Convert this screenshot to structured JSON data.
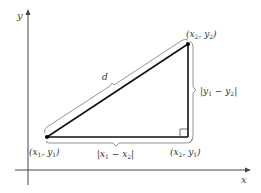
{
  "diagram": {
    "axes": {
      "x_label": "x",
      "y_label": "y"
    },
    "points": {
      "p1": {
        "label_main": "(x",
        "sub1": "1",
        "mid": ", y",
        "sub2": "1",
        "close": ")"
      },
      "p2": {
        "label_main": "(x",
        "sub1": "2",
        "mid": ", y",
        "sub2": "2",
        "close": ")"
      },
      "corner": {
        "label_main": "(x",
        "sub1": "2",
        "mid": ", y",
        "sub2": "1",
        "close": ")"
      }
    },
    "labels": {
      "distance": "d",
      "horizontal": {
        "open": "|x",
        "sub1": "1",
        "mid": " − x",
        "sub2": "2",
        "close": "|"
      },
      "vertical": {
        "open": "|y",
        "sub1": "1",
        "mid": " − y",
        "sub2": "2",
        "close": "|"
      }
    },
    "colors": {
      "line": "#111111",
      "brace": "#555555",
      "axis": "#444444"
    }
  }
}
